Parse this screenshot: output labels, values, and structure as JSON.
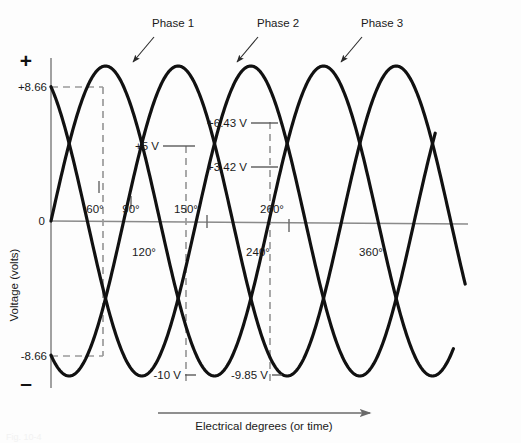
{
  "figure": {
    "background_color": "#fdfdfd",
    "wave_color": "#111111",
    "guide_color": "#9a9a9a",
    "axis_color": "#8a8a8a"
  },
  "axes": {
    "y_axis_label": "Voltage (volts)",
    "x_axis_label": "Electrical degrees (or time)",
    "positive_sign": "+",
    "negative_sign": "–",
    "zero_label": "0",
    "y_tick_positive": "+8.66",
    "y_tick_negative": "-8.66"
  },
  "phase_labels": [
    {
      "text": "Phase 1",
      "x": 152,
      "y": 27
    },
    {
      "text": "Phase 2",
      "x": 257,
      "y": 27
    },
    {
      "text": "Phase 3",
      "x": 361,
      "y": 27
    }
  ],
  "degree_labels": [
    {
      "text": "60°",
      "x": 95,
      "y": 213,
      "anchor": "middle"
    },
    {
      "text": "90°",
      "x": 131,
      "y": 213,
      "anchor": "middle"
    },
    {
      "text": "150°",
      "x": 186,
      "y": 213,
      "anchor": "middle"
    },
    {
      "text": "260°",
      "x": 272,
      "y": 213,
      "anchor": "middle"
    },
    {
      "text": "120°",
      "x": 144,
      "y": 256,
      "anchor": "middle"
    },
    {
      "text": "240°",
      "x": 258,
      "y": 256,
      "anchor": "middle"
    },
    {
      "text": "360°",
      "x": 371,
      "y": 256,
      "anchor": "middle"
    }
  ],
  "value_labels": [
    {
      "text": "+5 V",
      "x": 159,
      "y": 149,
      "anchor": "end"
    },
    {
      "text": "+6.43 V",
      "x": 247,
      "y": 127,
      "anchor": "end"
    },
    {
      "text": "+3.42 V",
      "x": 247,
      "y": 171,
      "anchor": "end"
    },
    {
      "text": "-10 V",
      "x": 181,
      "y": 378,
      "anchor": "end"
    },
    {
      "text": "-9.85 V",
      "x": 268,
      "y": 378,
      "anchor": "end"
    }
  ],
  "chart_data": {
    "type": "line",
    "xlabel": "Electrical degrees (or time)",
    "ylabel": "Voltage (volts)",
    "xlim": [
      0,
      720
    ],
    "ylim": [
      -10,
      10
    ],
    "grid": false,
    "legend": [
      "Phase 1",
      "Phase 2",
      "Phase 3"
    ],
    "amplitude_volts": 10,
    "phase_shift_degrees": 120,
    "x_tick_degrees": [
      60,
      90,
      120,
      150,
      240,
      260,
      360
    ],
    "y_annotated_values": [
      8.66,
      5,
      6.43,
      3.42,
      -8.66,
      -9.85,
      -10
    ],
    "series": [
      {
        "name": "Phase 1",
        "phase_offset_deg": 0,
        "peak_value": 10,
        "peak_at_deg": 90,
        "trough_value": -10,
        "trough_at_deg": 270
      },
      {
        "name": "Phase 2",
        "phase_offset_deg": -120,
        "peak_value": 10,
        "peak_at_deg": 210,
        "trough_value": -10,
        "trough_at_deg": 30
      },
      {
        "name": "Phase 3",
        "phase_offset_deg": -240,
        "peak_value": 10,
        "peak_at_deg": 330,
        "trough_value": -10,
        "trough_at_deg": 150
      }
    ],
    "annotations": [
      {
        "label": "+8.66",
        "degrees": 60,
        "volts": 8.66
      },
      {
        "label": "-8.66",
        "degrees": 60,
        "volts": -8.66
      },
      {
        "label": "+5 V",
        "degrees": 150,
        "volts": 5
      },
      {
        "label": "-10 V",
        "degrees": 150,
        "volts": -10
      },
      {
        "label": "+6.43 V",
        "degrees": 260,
        "volts": 6.43
      },
      {
        "label": "+3.42 V",
        "degrees": 260,
        "volts": 3.42
      },
      {
        "label": "-9.85 V",
        "degrees": 260,
        "volts": -9.85
      }
    ]
  },
  "caption": {
    "ghost_text": "Fig. 10-4"
  }
}
